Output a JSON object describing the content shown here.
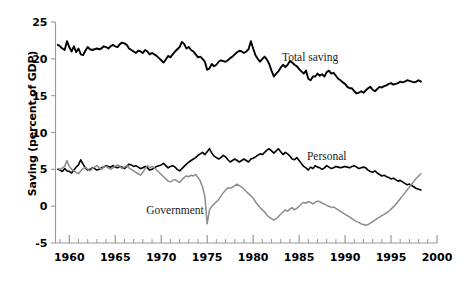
{
  "chart_data": {
    "type": "line",
    "title": "",
    "xlabel": "",
    "ylabel": "Saving (percent of GDP)",
    "xlim": [
      1958.5,
      2000
    ],
    "ylim": [
      -5,
      25
    ],
    "xticks": [
      1960,
      1965,
      1970,
      1975,
      1980,
      1985,
      1990,
      1995,
      2000
    ],
    "xtick_labels": [
      "1960",
      "1965",
      "1970",
      "1975",
      "1980",
      "1985",
      "1990",
      "1995",
      "2000"
    ],
    "minor_xtick_interval": 1,
    "yticks": [
      -5,
      0,
      5,
      10,
      15,
      20,
      25
    ],
    "ytick_labels": [
      "-5",
      "0",
      "5",
      "10",
      "15",
      "20",
      "25"
    ],
    "grid": false,
    "legend": "inline-annotations",
    "annotations": [
      {
        "text": "Total saving",
        "x": 1986.2,
        "y": 19.7
      },
      {
        "text": "Personal",
        "x": 1988.0,
        "y": 6.2
      },
      {
        "text": "Government",
        "x": 1971.5,
        "y": -1.0
      }
    ],
    "series": [
      {
        "name": "Total saving",
        "color": "#000000",
        "width": 1.9,
        "x": [
          1958.75,
          1959.0,
          1959.25,
          1959.5,
          1959.75,
          1960.0,
          1960.25,
          1960.5,
          1960.75,
          1961.0,
          1961.25,
          1961.5,
          1961.75,
          1962.0,
          1962.25,
          1962.5,
          1962.75,
          1963.0,
          1963.25,
          1963.5,
          1963.75,
          1964.0,
          1964.25,
          1964.5,
          1964.75,
          1965.0,
          1965.25,
          1965.5,
          1965.75,
          1966.0,
          1966.25,
          1966.5,
          1966.75,
          1967.0,
          1967.25,
          1967.5,
          1967.75,
          1968.0,
          1968.25,
          1968.5,
          1968.75,
          1969.0,
          1969.25,
          1969.5,
          1969.75,
          1970.0,
          1970.25,
          1970.5,
          1970.75,
          1971.0,
          1971.25,
          1971.5,
          1971.75,
          1972.0,
          1972.25,
          1972.5,
          1972.75,
          1973.0,
          1973.25,
          1973.5,
          1973.75,
          1974.0,
          1974.25,
          1974.5,
          1974.75,
          1975.0,
          1975.25,
          1975.5,
          1975.75,
          1976.0,
          1976.25,
          1976.5,
          1976.75,
          1977.0,
          1977.25,
          1977.5,
          1977.75,
          1978.0,
          1978.25,
          1978.5,
          1978.75,
          1979.0,
          1979.25,
          1979.5,
          1979.75,
          1980.0,
          1980.25,
          1980.5,
          1980.75,
          1981.0,
          1981.25,
          1981.5,
          1981.75,
          1982.0,
          1982.25,
          1982.5,
          1982.75,
          1983.0,
          1983.25,
          1983.5,
          1983.75,
          1984.0,
          1984.25,
          1984.5,
          1984.75,
          1985.0,
          1985.25,
          1985.5,
          1985.75,
          1986.0,
          1986.25,
          1986.5,
          1986.75,
          1987.0,
          1987.25,
          1987.5,
          1987.75,
          1988.0,
          1988.25,
          1988.5,
          1988.75,
          1989.0,
          1989.25,
          1989.5,
          1989.75,
          1990.0,
          1990.25,
          1990.5,
          1990.75,
          1991.0,
          1991.25,
          1991.5,
          1991.75,
          1992.0,
          1992.25,
          1992.5,
          1992.75,
          1993.0,
          1993.25,
          1993.5,
          1993.75,
          1994.0,
          1994.25,
          1994.5,
          1994.75,
          1995.0,
          1995.25,
          1995.5,
          1995.75,
          1996.0,
          1996.25,
          1996.5,
          1996.75,
          1997.0,
          1997.25,
          1997.5,
          1997.75,
          1998.0,
          1998.25
        ],
        "y": [
          21.9,
          21.7,
          21.4,
          21.2,
          22.4,
          21.6,
          21.0,
          21.7,
          20.9,
          21.4,
          20.6,
          20.5,
          21.1,
          21.6,
          21.3,
          21.2,
          21.3,
          21.4,
          21.3,
          21.4,
          21.7,
          21.6,
          21.4,
          21.7,
          21.9,
          21.7,
          21.6,
          22.0,
          22.2,
          22.1,
          21.9,
          21.4,
          21.2,
          21.0,
          20.8,
          21.1,
          21.0,
          20.8,
          21.2,
          21.0,
          20.6,
          20.8,
          20.6,
          20.4,
          20.1,
          19.8,
          19.5,
          19.9,
          20.4,
          20.2,
          20.6,
          21.0,
          21.3,
          21.6,
          22.3,
          22.0,
          21.4,
          21.6,
          21.2,
          21.0,
          20.6,
          20.2,
          20.3,
          20.0,
          19.6,
          18.5,
          18.7,
          19.3,
          19.0,
          19.2,
          19.6,
          19.8,
          19.7,
          19.6,
          19.8,
          20.1,
          20.3,
          20.6,
          20.9,
          21.1,
          21.0,
          20.8,
          21.0,
          21.3,
          22.4,
          21.4,
          20.5,
          20.0,
          19.6,
          20.0,
          20.3,
          19.9,
          19.3,
          18.4,
          17.6,
          18.0,
          18.3,
          18.8,
          19.2,
          18.9,
          19.2,
          19.7,
          19.5,
          19.2,
          19.0,
          18.6,
          18.3,
          18.0,
          18.4,
          17.3,
          17.1,
          17.6,
          17.6,
          18.0,
          17.7,
          17.9,
          17.6,
          18.2,
          18.4,
          18.0,
          18.1,
          17.7,
          17.3,
          17.1,
          16.8,
          16.6,
          16.2,
          16.0,
          16.0,
          15.6,
          15.3,
          15.4,
          15.6,
          15.4,
          15.7,
          16.0,
          16.2,
          15.8,
          15.6,
          15.9,
          16.2,
          16.1,
          16.3,
          16.4,
          16.6,
          16.7,
          16.5,
          16.6,
          16.7,
          16.9,
          16.8,
          16.9,
          17.1,
          17.0,
          16.9,
          16.8,
          16.9,
          17.1,
          16.9
        ]
      },
      {
        "name": "Personal",
        "color": "#000000",
        "width": 1.6,
        "x": [
          1958.75,
          1959.0,
          1959.25,
          1959.5,
          1959.75,
          1960.0,
          1960.25,
          1960.5,
          1960.75,
          1961.0,
          1961.25,
          1961.5,
          1961.75,
          1962.0,
          1962.25,
          1962.5,
          1962.75,
          1963.0,
          1963.25,
          1963.5,
          1963.75,
          1964.0,
          1964.25,
          1964.5,
          1964.75,
          1965.0,
          1965.25,
          1965.5,
          1965.75,
          1966.0,
          1966.25,
          1966.5,
          1966.75,
          1967.0,
          1967.25,
          1967.5,
          1967.75,
          1968.0,
          1968.25,
          1968.5,
          1968.75,
          1969.0,
          1969.25,
          1969.5,
          1969.75,
          1970.0,
          1970.25,
          1970.5,
          1970.75,
          1971.0,
          1971.25,
          1971.5,
          1971.75,
          1972.0,
          1972.25,
          1972.5,
          1972.75,
          1973.0,
          1973.25,
          1973.5,
          1973.75,
          1974.0,
          1974.25,
          1974.5,
          1974.75,
          1975.0,
          1975.25,
          1975.5,
          1975.75,
          1976.0,
          1976.25,
          1976.5,
          1976.75,
          1977.0,
          1977.25,
          1977.5,
          1977.75,
          1978.0,
          1978.25,
          1978.5,
          1978.75,
          1979.0,
          1979.25,
          1979.5,
          1979.75,
          1980.0,
          1980.25,
          1980.5,
          1980.75,
          1981.0,
          1981.25,
          1981.5,
          1981.75,
          1982.0,
          1982.25,
          1982.5,
          1982.75,
          1983.0,
          1983.25,
          1983.5,
          1983.75,
          1984.0,
          1984.25,
          1984.5,
          1984.75,
          1985.0,
          1985.25,
          1985.5,
          1985.75,
          1986.0,
          1986.25,
          1986.5,
          1986.75,
          1987.0,
          1987.25,
          1987.5,
          1987.75,
          1988.0,
          1988.25,
          1988.5,
          1988.75,
          1989.0,
          1989.25,
          1989.5,
          1989.75,
          1990.0,
          1990.25,
          1990.5,
          1990.75,
          1991.0,
          1991.25,
          1991.5,
          1991.75,
          1992.0,
          1992.25,
          1992.5,
          1992.75,
          1993.0,
          1993.25,
          1993.5,
          1993.75,
          1994.0,
          1994.25,
          1994.5,
          1994.75,
          1995.0,
          1995.25,
          1995.5,
          1995.75,
          1996.0,
          1996.25,
          1996.5,
          1996.75,
          1997.0,
          1997.25,
          1997.5,
          1997.75,
          1998.0,
          1998.25
        ],
        "y": [
          5.0,
          4.9,
          4.7,
          5.1,
          4.8,
          4.7,
          4.5,
          4.9,
          5.3,
          5.6,
          6.3,
          5.7,
          5.2,
          4.9,
          5.0,
          5.2,
          5.1,
          4.9,
          5.0,
          5.2,
          5.3,
          5.5,
          5.4,
          5.3,
          5.5,
          5.3,
          5.2,
          5.4,
          5.3,
          5.1,
          5.4,
          5.7,
          5.6,
          5.4,
          5.5,
          5.3,
          5.1,
          5.2,
          5.4,
          5.2,
          4.9,
          5.0,
          5.2,
          5.4,
          5.5,
          5.6,
          5.8,
          5.5,
          5.2,
          5.4,
          5.5,
          5.3,
          5.0,
          4.8,
          5.1,
          5.4,
          5.7,
          6.0,
          6.2,
          6.4,
          6.6,
          6.9,
          7.1,
          7.3,
          7.0,
          7.4,
          7.8,
          7.2,
          6.8,
          6.6,
          6.4,
          6.6,
          6.9,
          6.7,
          6.3,
          6.0,
          6.2,
          6.4,
          6.2,
          6.0,
          6.2,
          6.4,
          6.2,
          6.0,
          6.4,
          6.5,
          6.7,
          6.9,
          7.1,
          7.0,
          7.3,
          7.6,
          7.8,
          7.5,
          7.2,
          7.5,
          7.8,
          7.4,
          7.0,
          7.3,
          7.1,
          6.8,
          6.4,
          6.3,
          6.6,
          6.2,
          5.8,
          5.4,
          5.2,
          4.9,
          5.3,
          5.1,
          5.5,
          5.3,
          5.2,
          5.0,
          5.2,
          5.5,
          5.3,
          5.1,
          5.2,
          5.4,
          5.3,
          5.2,
          5.3,
          5.4,
          5.3,
          5.2,
          5.4,
          5.5,
          5.3,
          5.1,
          5.2,
          5.3,
          5.2,
          4.9,
          4.7,
          4.6,
          4.8,
          4.5,
          4.3,
          4.1,
          4.2,
          4.0,
          3.9,
          3.7,
          3.8,
          3.6,
          3.4,
          3.5,
          3.3,
          3.1,
          2.9,
          3.0,
          2.8,
          2.6,
          2.4,
          2.3,
          2.2
        ]
      },
      {
        "name": "Government",
        "color": "#8c8c8c",
        "width": 1.5,
        "x": [
          1958.75,
          1959.0,
          1959.25,
          1959.5,
          1959.75,
          1960.0,
          1960.25,
          1960.5,
          1960.75,
          1961.0,
          1961.25,
          1961.5,
          1961.75,
          1962.0,
          1962.25,
          1962.5,
          1962.75,
          1963.0,
          1963.25,
          1963.5,
          1963.75,
          1964.0,
          1964.25,
          1964.5,
          1964.75,
          1965.0,
          1965.25,
          1965.5,
          1965.75,
          1966.0,
          1966.25,
          1966.5,
          1966.75,
          1967.0,
          1967.25,
          1967.5,
          1967.75,
          1968.0,
          1968.25,
          1968.5,
          1968.75,
          1969.0,
          1969.25,
          1969.5,
          1969.75,
          1970.0,
          1970.25,
          1970.5,
          1970.75,
          1971.0,
          1971.25,
          1971.5,
          1971.75,
          1972.0,
          1972.25,
          1972.5,
          1972.75,
          1973.0,
          1973.25,
          1973.5,
          1973.75,
          1974.0,
          1974.25,
          1974.5,
          1974.75,
          1975.0,
          1975.25,
          1975.5,
          1975.75,
          1976.0,
          1976.25,
          1976.5,
          1976.75,
          1977.0,
          1977.25,
          1977.5,
          1977.75,
          1978.0,
          1978.25,
          1978.5,
          1978.75,
          1979.0,
          1979.25,
          1979.5,
          1979.75,
          1980.0,
          1980.25,
          1980.5,
          1980.75,
          1981.0,
          1981.25,
          1981.5,
          1981.75,
          1982.0,
          1982.25,
          1982.5,
          1982.75,
          1983.0,
          1983.25,
          1983.5,
          1983.75,
          1984.0,
          1984.25,
          1984.5,
          1984.75,
          1985.0,
          1985.25,
          1985.5,
          1985.75,
          1986.0,
          1986.25,
          1986.5,
          1986.75,
          1987.0,
          1987.25,
          1987.5,
          1987.75,
          1988.0,
          1988.25,
          1988.5,
          1988.75,
          1989.0,
          1989.25,
          1989.5,
          1989.75,
          1990.0,
          1990.25,
          1990.5,
          1990.75,
          1991.0,
          1991.25,
          1991.5,
          1991.75,
          1992.0,
          1992.25,
          1992.5,
          1992.75,
          1993.0,
          1993.25,
          1993.5,
          1993.75,
          1994.0,
          1994.25,
          1994.5,
          1994.75,
          1995.0,
          1995.25,
          1995.5,
          1995.75,
          1996.0,
          1996.25,
          1996.5,
          1996.75,
          1997.0,
          1997.25,
          1997.5,
          1997.75,
          1998.0,
          1998.25
        ],
        "y": [
          5.1,
          5.0,
          5.2,
          5.4,
          6.2,
          5.4,
          5.0,
          4.8,
          4.6,
          4.4,
          4.8,
          5.1,
          5.3,
          5.0,
          4.8,
          5.1,
          5.3,
          5.5,
          5.2,
          5.0,
          5.3,
          5.4,
          5.2,
          5.0,
          5.2,
          5.4,
          5.6,
          5.4,
          5.1,
          5.3,
          5.5,
          5.2,
          5.0,
          4.8,
          4.6,
          4.4,
          4.2,
          4.6,
          5.1,
          5.5,
          5.2,
          5.4,
          5.2,
          4.9,
          4.6,
          4.3,
          4.0,
          3.7,
          3.4,
          3.3,
          3.5,
          3.6,
          3.4,
          3.2,
          3.6,
          3.9,
          4.1,
          4.0,
          4.2,
          4.1,
          4.3,
          3.9,
          3.4,
          2.6,
          1.3,
          -2.4,
          -0.5,
          0.0,
          0.3,
          0.6,
          0.9,
          1.4,
          1.8,
          2.2,
          2.5,
          2.4,
          2.6,
          2.8,
          3.0,
          2.8,
          2.6,
          2.3,
          2.0,
          1.7,
          1.4,
          1.1,
          0.6,
          0.2,
          -0.2,
          -0.5,
          -0.8,
          -1.2,
          -1.5,
          -1.7,
          -1.9,
          -1.7,
          -1.4,
          -1.1,
          -0.8,
          -0.5,
          -0.7,
          -0.4,
          -0.2,
          -0.5,
          -0.3,
          0.0,
          0.3,
          0.5,
          0.4,
          0.6,
          0.5,
          0.3,
          0.5,
          0.7,
          0.6,
          0.4,
          0.3,
          0.1,
          0.0,
          -0.2,
          -0.1,
          -0.3,
          -0.5,
          -0.7,
          -0.9,
          -1.1,
          -1.3,
          -1.5,
          -1.7,
          -1.9,
          -2.1,
          -2.2,
          -2.4,
          -2.5,
          -2.6,
          -2.5,
          -2.3,
          -2.1,
          -1.9,
          -1.7,
          -1.5,
          -1.3,
          -1.1,
          -0.9,
          -0.7,
          -0.4,
          -0.1,
          0.2,
          0.6,
          1.0,
          1.4,
          1.8,
          2.2,
          2.6,
          3.0,
          3.4,
          3.8,
          4.1,
          4.4
        ]
      }
    ]
  }
}
